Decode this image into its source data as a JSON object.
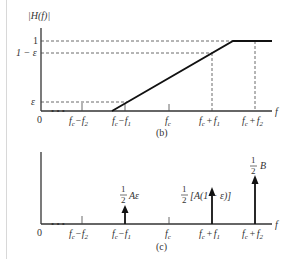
{
  "figure_b": {
    "ylabel": "|H(f)|",
    "y_ticks": [
      "1",
      "1 − ε",
      "ε"
    ],
    "x_origin": "0",
    "x_ticks": [
      "f_c − f_2",
      "f_c − f_1",
      "f_c",
      "f_c + f_1",
      "f_c + f_2"
    ],
    "xlabel": "f",
    "caption": "(b)"
  },
  "figure_c": {
    "x_origin": "0",
    "x_ticks": [
      "f_c − f_2",
      "f_c − f_1",
      "f_c",
      "f_c + f_1",
      "f_c + f_2"
    ],
    "xlabel": "f",
    "impulses": [
      {
        "at": "f_c − f_1",
        "label_frac": "1/2",
        "label_rest": "Aε"
      },
      {
        "at": "f_c + f_1",
        "label_frac": "1/2",
        "label_rest": "[A(1 − ε)]"
      },
      {
        "at": "f_c + f_2",
        "label_frac": "1/2",
        "label_rest": "B"
      }
    ],
    "caption": "(c)"
  },
  "text": {
    "H": "|H(f)|",
    "one": "1",
    "one_minus_eps": "1 − ε",
    "eps": "ε",
    "zero": "0",
    "f": "f",
    "fc": "f",
    "c": "c",
    "minus": "−",
    "plus": "+",
    "f1": "f",
    "f2": "f",
    "s1": "1",
    "s2": "2",
    "cap_b": "(b)",
    "cap_c": "(c)",
    "half_num": "1",
    "half_den": "2",
    "Aeps": "Aε",
    "A1eps": "[A(1 − ε)]",
    "B": "B",
    "dots": "• • •"
  }
}
